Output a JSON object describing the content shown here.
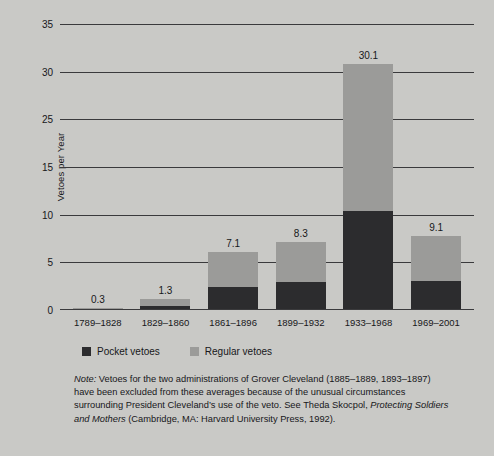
{
  "chart_data": {
    "type": "bar",
    "stacked": true,
    "title": "",
    "xlabel": "",
    "ylabel": "Vetoes per Year",
    "ylim": [
      0,
      35
    ],
    "grid": true,
    "legend_position": "below-plot",
    "categories": [
      "1789–1828",
      "1829–1860",
      "1861–1896",
      "1899–1932",
      "1933–1968",
      "1969–2001"
    ],
    "ytick_labels": [
      "35",
      "30",
      "25",
      "15",
      "10",
      "5",
      "0"
    ],
    "ytick_values": [
      35,
      30,
      25,
      20,
      15,
      10,
      5,
      0
    ],
    "totals": [
      0.3,
      1.3,
      7.1,
      8.3,
      30.1,
      9.1
    ],
    "total_labels": [
      "0.3",
      "1.3",
      "7.1",
      "8.3",
      "30.1",
      "9.1"
    ],
    "series": [
      {
        "name": "Pocket vetoes",
        "color": "#2c2c2e",
        "values": [
          0.1,
          0.5,
          2.8,
          3.4,
          12.1,
          3.5
        ]
      },
      {
        "name": "Regular vetoes",
        "color": "#9b9b99",
        "values": [
          0.2,
          0.8,
          4.3,
          4.9,
          18.0,
          5.6
        ]
      }
    ]
  },
  "legend": {
    "items": [
      {
        "label": "Pocket vetoes",
        "color": "#2c2c2e"
      },
      {
        "label": "Regular vetoes",
        "color": "#9b9b99"
      }
    ]
  },
  "note": {
    "label": "Note:",
    "line1_a": " Vetoes for the two administrations of Grover Cleveland (1885–1889, 1893–1897) have been excluded from these averages because of the unusual circumstances surrounding President Cleveland’s use of the veto. See Theda Skocpol, ",
    "italic_title": "Protecting Soldiers and Mothers",
    "line1_b": " (Cambridge, MA: Harvard University Press, 1992)."
  },
  "colors": {
    "background": "#c9c9c6",
    "plot_background": "#d2d2cf",
    "axis": "#3a3a3c",
    "pocket": "#2c2c2e",
    "regular": "#9b9b99",
    "text": "#17171a"
  }
}
